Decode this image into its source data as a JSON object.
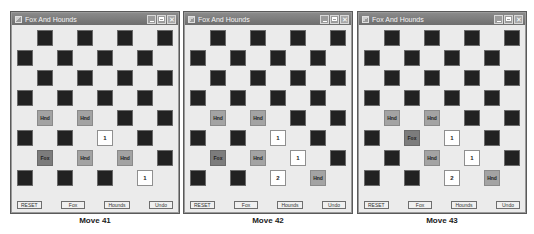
{
  "window_title": "Fox And Hounds",
  "buttons": {
    "reset": "RESET",
    "fox": "Fox",
    "hounds": "Hounds",
    "undo": "Undo"
  },
  "piece_labels": {
    "hound": "Hnd",
    "fox": "Fox"
  },
  "colors": {
    "dark_square": "#222222",
    "light_square": "#ebebeb",
    "hound": "#a3a3a3",
    "fox": "#7c7c7c",
    "marker": "#ffffff",
    "titlebar": "#7a7a7a"
  },
  "boards": [
    {
      "caption": "Move 41",
      "rows": [
        [
          "",
          "D",
          "",
          "D",
          "",
          "D",
          "",
          "D"
        ],
        [
          "D",
          "",
          "D",
          "",
          "D",
          "",
          "D",
          ""
        ],
        [
          "",
          "D",
          "",
          "D",
          "",
          "D",
          "",
          "D"
        ],
        [
          "D",
          "",
          "D",
          "",
          "D",
          "",
          "D",
          ""
        ],
        [
          "",
          "H",
          "",
          "H",
          "",
          "D",
          "",
          "D"
        ],
        [
          "D",
          "",
          "D",
          "",
          "1",
          "",
          "D",
          ""
        ],
        [
          "",
          "F",
          "",
          "H",
          "",
          "H",
          "",
          "D"
        ],
        [
          "D",
          "",
          "D",
          "",
          "D",
          "",
          "1",
          ""
        ]
      ]
    },
    {
      "caption": "Move 42",
      "rows": [
        [
          "",
          "D",
          "",
          "D",
          "",
          "D",
          "",
          "D"
        ],
        [
          "D",
          "",
          "D",
          "",
          "D",
          "",
          "D",
          ""
        ],
        [
          "",
          "D",
          "",
          "D",
          "",
          "D",
          "",
          "D"
        ],
        [
          "D",
          "",
          "D",
          "",
          "D",
          "",
          "D",
          ""
        ],
        [
          "",
          "H",
          "",
          "H",
          "",
          "D",
          "",
          "D"
        ],
        [
          "D",
          "",
          "D",
          "",
          "1",
          "",
          "D",
          ""
        ],
        [
          "",
          "F",
          "",
          "H",
          "",
          "1",
          "",
          "D"
        ],
        [
          "D",
          "",
          "D",
          "",
          "2",
          "",
          "H",
          ""
        ]
      ]
    },
    {
      "caption": "Move 43",
      "rows": [
        [
          "",
          "D",
          "",
          "D",
          "",
          "D",
          "",
          "D"
        ],
        [
          "D",
          "",
          "D",
          "",
          "D",
          "",
          "D",
          ""
        ],
        [
          "",
          "D",
          "",
          "D",
          "",
          "D",
          "",
          "D"
        ],
        [
          "D",
          "",
          "D",
          "",
          "D",
          "",
          "D",
          ""
        ],
        [
          "",
          "H",
          "",
          "H",
          "",
          "D",
          "",
          "D"
        ],
        [
          "D",
          "",
          "F",
          "",
          "1",
          "",
          "D",
          ""
        ],
        [
          "",
          "D",
          "",
          "H",
          "",
          "1",
          "",
          "D"
        ],
        [
          "D",
          "",
          "D",
          "",
          "2",
          "",
          "H",
          ""
        ]
      ]
    }
  ]
}
